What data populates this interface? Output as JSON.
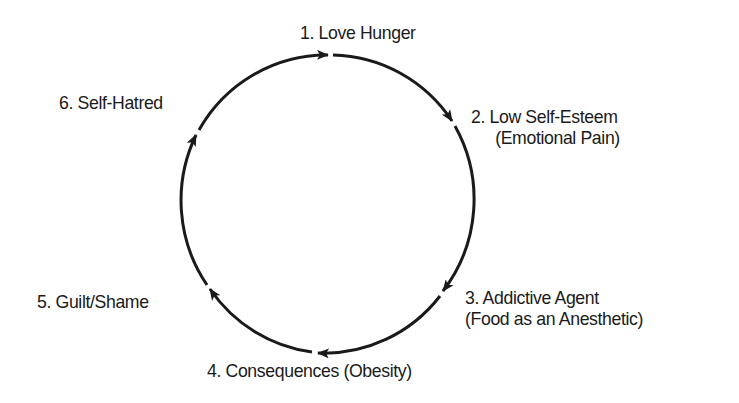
{
  "diagram": {
    "type": "cycle",
    "direction": "clockwise",
    "line_color": "#1a1a1a",
    "background": "#ffffff",
    "stages": [
      {
        "number": "1.",
        "line1": "1. Love Hunger",
        "line2": ""
      },
      {
        "number": "2.",
        "line1": "2. Low Self-Esteem",
        "line2": "(Emotional Pain)"
      },
      {
        "number": "3.",
        "line1": "3. Addictive Agent",
        "line2": "(Food as an Anesthetic)"
      },
      {
        "number": "4.",
        "line1": "4. Consequences (Obesity)",
        "line2": ""
      },
      {
        "number": "5.",
        "line1": "5. Guilt/Shame",
        "line2": ""
      },
      {
        "number": "6.",
        "line1": "6. Self-Hatred",
        "line2": ""
      }
    ],
    "edges": [
      {
        "from": "1",
        "to": "2"
      },
      {
        "from": "2",
        "to": "3"
      },
      {
        "from": "3",
        "to": "4"
      },
      {
        "from": "4",
        "to": "5"
      },
      {
        "from": "5",
        "to": "6"
      },
      {
        "from": "6",
        "to": "1"
      }
    ]
  }
}
